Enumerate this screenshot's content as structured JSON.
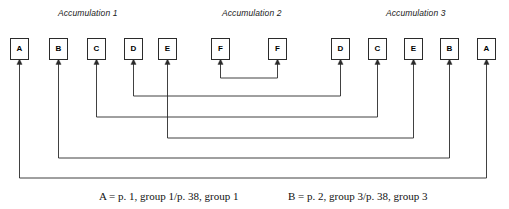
{
  "diagram": {
    "type": "node-link-bracket-diagram",
    "canvas": {
      "width": 509,
      "height": 209,
      "background": "#ffffff"
    },
    "line_color": "#2b2b2b",
    "box_border_color": "#2b2b2b",
    "text_color": "#000000",
    "accumulation_labels": [
      {
        "text": "Accumulation 1",
        "x": 58,
        "y": 8
      },
      {
        "text": "Accumulation 2",
        "x": 222,
        "y": 8
      },
      {
        "text": "Accumulation 3",
        "x": 386,
        "y": 8
      }
    ],
    "nodes": [
      {
        "id": "n1",
        "label": "A",
        "x": 10,
        "y": 38,
        "center_x": 19.5
      },
      {
        "id": "n2",
        "label": "B",
        "x": 49,
        "y": 38,
        "center_x": 58.5
      },
      {
        "id": "n3",
        "label": "C",
        "x": 87,
        "y": 38,
        "center_x": 96.5
      },
      {
        "id": "n4",
        "label": "D",
        "x": 124,
        "y": 38,
        "center_x": 133.5
      },
      {
        "id": "n5",
        "label": "E",
        "x": 158,
        "y": 38,
        "center_x": 167.5
      },
      {
        "id": "n6",
        "label": "F",
        "x": 211,
        "y": 38,
        "center_x": 220.5
      },
      {
        "id": "n7",
        "label": "F",
        "x": 268,
        "y": 38,
        "center_x": 277.5
      },
      {
        "id": "n8",
        "label": "D",
        "x": 331,
        "y": 38,
        "center_x": 340.5
      },
      {
        "id": "n9",
        "label": "C",
        "x": 368,
        "y": 38,
        "center_x": 377.5
      },
      {
        "id": "n10",
        "label": "E",
        "x": 404,
        "y": 38,
        "center_x": 413.5
      },
      {
        "id": "n11",
        "label": "B",
        "x": 440,
        "y": 38,
        "center_x": 449.5
      },
      {
        "id": "n12",
        "label": "A",
        "x": 477,
        "y": 38,
        "center_x": 486.5
      }
    ],
    "connectors": [
      {
        "name": "f-to-f-connector",
        "label": "F",
        "from": "n6",
        "to": "n7",
        "left_x": 220.5,
        "right_x": 277.5,
        "depth_y": 78
      },
      {
        "name": "d-to-d-connector",
        "label": "D",
        "from": "n4",
        "to": "n8",
        "left_x": 133.5,
        "right_x": 340.5,
        "depth_y": 96
      },
      {
        "name": "c-to-c-connector",
        "label": "C",
        "from": "n3",
        "to": "n9",
        "left_x": 96.5,
        "right_x": 377.5,
        "depth_y": 117
      },
      {
        "name": "e-to-e-connector",
        "label": "E",
        "from": "n5",
        "to": "n10",
        "left_x": 167.5,
        "right_x": 413.5,
        "depth_y": 138
      },
      {
        "name": "b-to-b-connector",
        "label": "B",
        "from": "n2",
        "to": "n11",
        "left_x": 58.5,
        "right_x": 449.5,
        "depth_y": 158
      },
      {
        "name": "a-to-a-connector",
        "label": "A",
        "from": "n1",
        "to": "n12",
        "left_x": 19.5,
        "right_x": 486.5,
        "depth_y": 178
      }
    ],
    "arrow_tip_y": 61,
    "captions": [
      {
        "name": "caption-a",
        "text": "A = p. 1, group 1/p. 38, group 1",
        "x": 99,
        "y": 190
      },
      {
        "name": "caption-b",
        "text": "B = p. 2, group 3/p. 38, group 3",
        "x": 288,
        "y": 190
      }
    ]
  }
}
